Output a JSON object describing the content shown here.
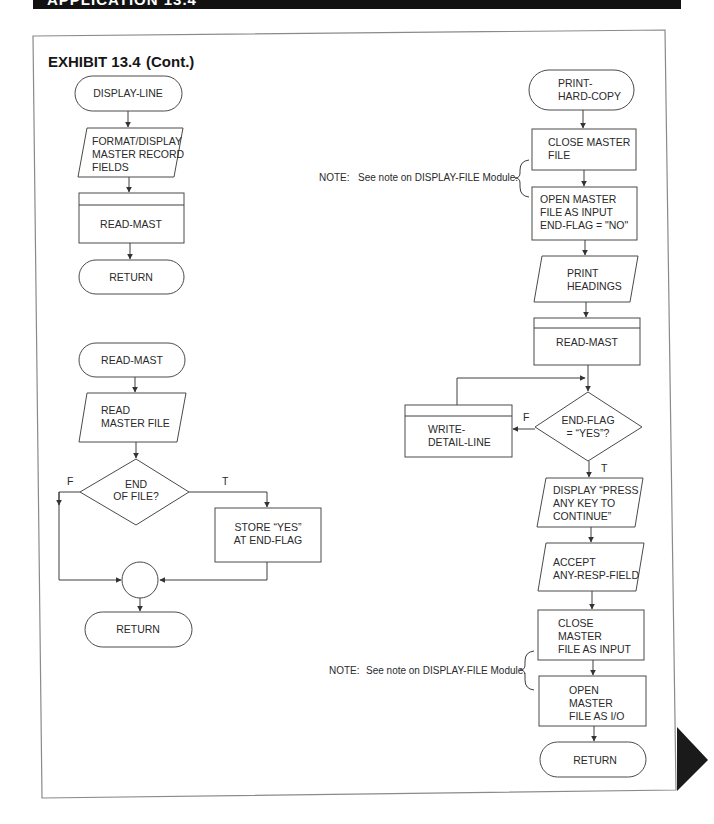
{
  "header": {
    "banner_text": "APPLICATION 13.4"
  },
  "exhibit": {
    "title": "EXHIBIT 13.4",
    "subtitle": "(Cont.)"
  },
  "display_line_module": {
    "start": "DISPLAY-LINE",
    "step1": [
      "FORMAT/DISPLAY",
      "MASTER RECORD",
      "FIELDS"
    ],
    "step2": "READ-MAST",
    "end": "RETURN"
  },
  "read_mast_module": {
    "start": "READ-MAST",
    "step1": [
      "READ",
      "MASTER FILE"
    ],
    "decision": [
      "END",
      "OF FILE?"
    ],
    "false_label": "F",
    "true_label": "T",
    "true_action": [
      "STORE “YES”",
      "AT END-FLAG"
    ],
    "end": "RETURN"
  },
  "print_hard_copy_module": {
    "start": [
      "PRINT-",
      "HARD-COPY"
    ],
    "step1": [
      "CLOSE MASTER",
      "FILE"
    ],
    "step2": [
      "OPEN MASTER",
      "FILE AS INPUT",
      "END-FLAG = \"NO\""
    ],
    "step3": [
      "PRINT",
      "HEADINGS"
    ],
    "step4": "READ-MAST",
    "decision": [
      "END-FLAG",
      "=  “YES”?"
    ],
    "false_label": "F",
    "true_label": "T",
    "false_action": [
      "WRITE-",
      "DETAIL-LINE"
    ],
    "step5": [
      "DISPLAY “PRESS",
      "ANY KEY TO",
      "CONTINUE”"
    ],
    "step6": [
      "ACCEPT",
      "ANY-RESP-FIELD"
    ],
    "step7": [
      "CLOSE",
      "MASTER",
      "FILE AS INPUT"
    ],
    "step8": [
      "OPEN",
      "MASTER",
      "FILE AS I/O"
    ],
    "end": "RETURN"
  },
  "notes": [
    {
      "label": "NOTE:",
      "text": "See note on DISPLAY-FILE Module."
    },
    {
      "label": "NOTE:",
      "text": "See note on DISPLAY-FILE Module."
    }
  ],
  "colors": {
    "banner": "#121212",
    "page_edge_tab": "#1a1a1a",
    "line": "#3f3f3f"
  }
}
